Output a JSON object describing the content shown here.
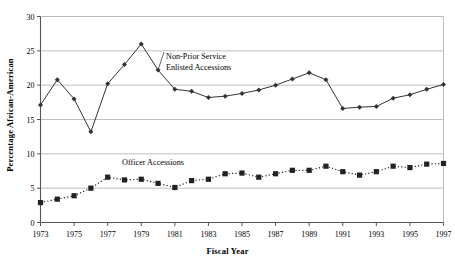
{
  "chart_data": {
    "type": "line",
    "title": "",
    "xlabel": "Fiscal Year",
    "ylabel": "Percentage African-American",
    "xlim": [
      1973,
      1997
    ],
    "ylim": [
      0,
      30
    ],
    "yticks": [
      0,
      5,
      10,
      15,
      20,
      25,
      30
    ],
    "xticks": [
      1973,
      1975,
      1977,
      1979,
      1981,
      1983,
      1985,
      1987,
      1989,
      1991,
      1993,
      1995,
      1997
    ],
    "grid": "horizontal",
    "legend_position": "inline-annotation",
    "x": [
      1973,
      1974,
      1975,
      1976,
      1977,
      1978,
      1979,
      1980,
      1981,
      1982,
      1983,
      1984,
      1985,
      1986,
      1987,
      1988,
      1989,
      1990,
      1991,
      1992,
      1993,
      1994,
      1995,
      1996,
      1997
    ],
    "series": [
      {
        "name": "Non-Prior Service Enlisted Accessions",
        "label_line1": "Non-Prior Service",
        "label_line2": "Enlisted Accessions",
        "marker": "diamond",
        "line_style": "solid",
        "color": "#333333",
        "values": [
          17.1,
          20.8,
          18.0,
          13.2,
          20.2,
          23.0,
          26.0,
          22.2,
          19.4,
          19.1,
          18.2,
          18.4,
          18.8,
          19.3,
          20.0,
          20.9,
          21.8,
          20.8,
          16.6,
          16.8,
          16.9,
          18.1,
          18.6,
          19.4,
          20.1
        ]
      },
      {
        "name": "Officer Accessions",
        "label_line1": "Officer Accessions",
        "label_line2": "",
        "marker": "square",
        "line_style": "dotted",
        "color": "#222222",
        "values": [
          2.9,
          3.4,
          3.9,
          5.0,
          6.6,
          6.2,
          6.3,
          5.7,
          5.1,
          6.1,
          6.3,
          7.1,
          7.2,
          6.6,
          7.1,
          7.6,
          7.6,
          8.2,
          7.4,
          6.9,
          7.4,
          8.2,
          8.0,
          8.5,
          8.6
        ]
      }
    ]
  },
  "axes": {
    "x_title": "Fiscal Year",
    "y_title": "Percentage African-American",
    "x_tick_labels": [
      "1973",
      "1975",
      "1977",
      "1979",
      "1981",
      "1983",
      "1985",
      "1987",
      "1989",
      "1991",
      "1993",
      "1995",
      "1997"
    ],
    "y_tick_labels": [
      "0",
      "5",
      "10",
      "15",
      "20",
      "25",
      "30"
    ]
  },
  "annotations": {
    "enlisted_line1": "Non-Prior Service",
    "enlisted_line2": "Enlisted Accessions",
    "officer_line1": "Officer Accessions"
  },
  "colors": {
    "line": "#333333",
    "grid": "#b8b8b8",
    "axis": "#6e6e6e",
    "background": "#ffffff"
  }
}
